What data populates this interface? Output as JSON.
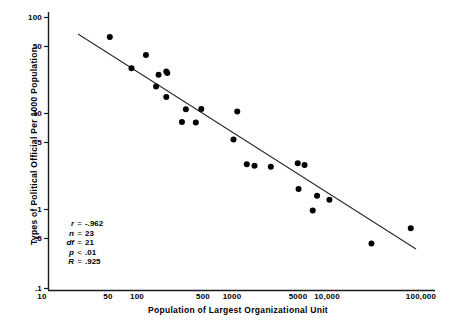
{
  "chart_data": {
    "type": "scatter",
    "title": "",
    "xlabel": "Population of Largest Organizational Unit",
    "ylabel": "Types of Political Official Per 1000 Population",
    "xscale": "log",
    "yscale": "log",
    "xlim": [
      10,
      100000
    ],
    "ylim": [
      0.1,
      100
    ],
    "grid": false,
    "legend": null,
    "xticks": [
      {
        "label": "10",
        "value": 10,
        "px": 42
      },
      {
        "label": "50",
        "value": 50,
        "px": 108
      },
      {
        "label": "100",
        "value": 100,
        "px": 137
      },
      {
        "label": "500",
        "value": 500,
        "px": 203
      },
      {
        "label": "1000",
        "value": 1000,
        "px": 232
      },
      {
        "label": "5000",
        "value": 5000,
        "px": 298
      },
      {
        "label": "10,000",
        "value": 10000,
        "px": 327
      },
      {
        "label": "100,000",
        "value": 100000,
        "px": 421
      }
    ],
    "yticks": [
      {
        "label": "100",
        "value": 100,
        "px": 17
      },
      {
        "label": "50",
        "value": 50,
        "px": 46
      },
      {
        "label": "10",
        "value": 10,
        "px": 113
      },
      {
        "label": "5",
        "value": 5,
        "px": 142
      },
      {
        "label": "1",
        "value": 1,
        "px": 209
      },
      {
        "label": ".5",
        "value": 0.5,
        "px": 238
      },
      {
        "label": ".1",
        "value": 0.1,
        "px": 288
      }
    ],
    "points": [
      {
        "x": 52,
        "y": 60
      },
      {
        "x": 125,
        "y": 38
      },
      {
        "x": 88,
        "y": 27
      },
      {
        "x": 170,
        "y": 23
      },
      {
        "x": 205,
        "y": 25
      },
      {
        "x": 210,
        "y": 24
      },
      {
        "x": 160,
        "y": 17
      },
      {
        "x": 205,
        "y": 13
      },
      {
        "x": 330,
        "y": 9.5
      },
      {
        "x": 480,
        "y": 9.6
      },
      {
        "x": 300,
        "y": 6.9
      },
      {
        "x": 420,
        "y": 6.8
      },
      {
        "x": 1150,
        "y": 9.0
      },
      {
        "x": 1050,
        "y": 4.4
      },
      {
        "x": 1450,
        "y": 2.35
      },
      {
        "x": 1750,
        "y": 2.25
      },
      {
        "x": 2600,
        "y": 2.2
      },
      {
        "x": 5000,
        "y": 2.4
      },
      {
        "x": 5900,
        "y": 2.3
      },
      {
        "x": 5100,
        "y": 1.25
      },
      {
        "x": 8000,
        "y": 1.05
      },
      {
        "x": 10800,
        "y": 0.95
      },
      {
        "x": 7200,
        "y": 0.72
      },
      {
        "x": 30000,
        "y": 0.31
      },
      {
        "x": 78000,
        "y": 0.46
      }
    ],
    "fit_line": {
      "x_start_px": 78,
      "y_start_px": 34,
      "x_end_px": 416,
      "y_end_px": 249
    },
    "annotations": {
      "stats": [
        {
          "symbol": "r",
          "operator": "=",
          "value": "-.962"
        },
        {
          "symbol": "n",
          "operator": "=",
          "value": "23"
        },
        {
          "symbol": "df",
          "operator": "=",
          "value": "21"
        },
        {
          "symbol": "p",
          "operator": "<",
          "value": ".01"
        },
        {
          "symbol": "R",
          "operator": "=",
          "value": ".925"
        }
      ]
    }
  }
}
